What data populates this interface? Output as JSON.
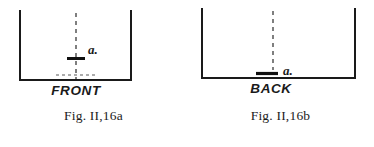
{
  "plate": {
    "background_color": "#ffffff",
    "ink_color": "#1a1a1a",
    "width": 374,
    "height": 147
  },
  "figures": [
    {
      "id": "a",
      "caption": "Fig. II,16a",
      "base_label": "FRONT",
      "marker_label": "a.",
      "marker_position": "middle",
      "description": "Open-topped rectangular vessel seen from the front, with a vertical dashed centre line running the full height and a short thick horizontal marker crossing it at mid-height.",
      "container": {
        "left_wall_x": 20,
        "right_wall_x": 131,
        "top_y": 11,
        "bottom_y": 80,
        "stroke_width": 2.0,
        "open_top": true
      },
      "centerline": {
        "x": 76,
        "top_y": 13,
        "bottom_y": 79,
        "style": "dashed",
        "dash_pattern": "4 4",
        "stroke_width": 1.2
      },
      "marker": {
        "x_center": 76,
        "y": 58,
        "half_width": 9,
        "stroke_width": 3.0
      },
      "inner_dashed_line": {
        "present": true,
        "y": 75,
        "x_start": 56,
        "x_end": 97,
        "dash_pattern": "3 3",
        "stroke_width": 1.2
      },
      "marker_label_pos": {
        "x": 88,
        "y": 54
      },
      "base_label_pos": {
        "x": 76,
        "y": 94
      }
    },
    {
      "id": "b",
      "caption": "Fig. II,16b",
      "base_label": "BACK",
      "marker_label": "a.",
      "marker_position": "bottom",
      "description": "Open-topped rectangular vessel seen from the back, with a vertical dashed centre line ending at a short thick horizontal marker resting just above the base.",
      "container": {
        "left_wall_x": 15,
        "right_wall_x": 168,
        "top_y": 9,
        "bottom_y": 78,
        "stroke_width": 2.0,
        "open_top": true
      },
      "centerline": {
        "x": 86,
        "top_y": 11,
        "bottom_y": 70,
        "style": "dashed",
        "dash_pattern": "4 4",
        "stroke_width": 1.2
      },
      "marker": {
        "x_center": 80,
        "y": 73,
        "half_width": 11,
        "stroke_width": 3.0
      },
      "inner_dashed_line": {
        "present": false
      },
      "marker_label_pos": {
        "x": 95,
        "y": 70
      },
      "base_label_pos": {
        "x": 84,
        "y": 92
      }
    }
  ]
}
